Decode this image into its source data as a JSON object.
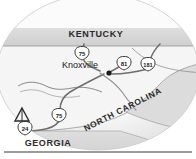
{
  "figure": {
    "name": "knoxville-region-map",
    "width": 196,
    "height": 159,
    "background_color": "#ffffff",
    "vignette_color": "#e8e8e8",
    "land_fill": "#f2f2f2",
    "state_band_fill": "#d9d9d9",
    "water_fill": "#ffffff",
    "road_color": "#6e6e6e",
    "outline_color": "#555555",
    "text_color": "#2b2b2b",
    "rule_color": "#3a3a3a"
  },
  "states": [
    {
      "id": "kentucky",
      "label": "KENTUCKY",
      "x": 96,
      "y": 37,
      "rotation": 0,
      "font_size": 9
    },
    {
      "id": "north-carolina",
      "label": "NORTH CAROLINA",
      "x": 124,
      "y": 112,
      "rotation": -27,
      "font_size": 8.5
    },
    {
      "id": "georgia",
      "label": "GEORGIA",
      "x": 48,
      "y": 146,
      "rotation": 0,
      "font_size": 9
    }
  ],
  "cities": [
    {
      "id": "knoxville",
      "label": "Knoxville",
      "label_x": 62,
      "label_y": 68,
      "dot_x": 109,
      "dot_y": 73,
      "font_size": 9
    }
  ],
  "shields": [
    {
      "id": "shield-75-north",
      "route": "75",
      "x": 82,
      "y": 53,
      "type": "interstate"
    },
    {
      "id": "shield-81",
      "route": "81",
      "x": 124,
      "y": 63,
      "type": "interstate"
    },
    {
      "id": "shield-181",
      "route": "181",
      "x": 148,
      "y": 64,
      "type": "interstate"
    },
    {
      "id": "shield-75-south",
      "route": "75",
      "x": 59,
      "y": 115,
      "type": "interstate"
    },
    {
      "id": "shield-24",
      "route": "24",
      "x": 25,
      "y": 128,
      "type": "interstate"
    }
  ],
  "symbols": [
    {
      "id": "campground",
      "icon": "tent-icon",
      "x": 22,
      "y": 116,
      "description": "campground tent marker"
    }
  ],
  "rule": {
    "id": "bottom-rule",
    "x1": 4,
    "x2": 192,
    "y": 152
  }
}
